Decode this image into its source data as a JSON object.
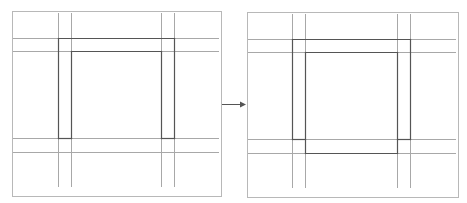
{
  "diagram": {
    "colors": {
      "panel_border": "#b8b8b8",
      "guide_line": "#a8a8a8",
      "frame_line": "#555555",
      "arrow": "#555555",
      "background": "#ffffff"
    },
    "panels": [
      {
        "name": "before",
        "border": {
          "x": 12,
          "y": 11,
          "w": 209,
          "h": 185
        },
        "vertical_guides": [
          58,
          71,
          161,
          174
        ],
        "vertical_guide_span": [
          13,
          187
        ],
        "horizontal_guides": [
          38,
          51,
          138,
          152
        ],
        "horizontal_guide_span": [
          13,
          219
        ],
        "frame_segments": [
          [
            58,
            38,
            174,
            38
          ],
          [
            58,
            38,
            58,
            138
          ],
          [
            174,
            38,
            174,
            138
          ],
          [
            58,
            138,
            71,
            138
          ],
          [
            161,
            138,
            174,
            138
          ],
          [
            71,
            51,
            161,
            51
          ],
          [
            71,
            51,
            71,
            138
          ],
          [
            161,
            51,
            161,
            138
          ]
        ]
      },
      {
        "name": "after",
        "border": {
          "x": 247,
          "y": 12,
          "w": 211,
          "h": 185
        },
        "vertical_guides": [
          292,
          305,
          397,
          410
        ],
        "vertical_guide_span": [
          14,
          188
        ],
        "horizontal_guides": [
          39,
          52,
          139,
          153
        ],
        "horizontal_guide_span": [
          248,
          456
        ],
        "frame_segments": [
          [
            292,
            39,
            410,
            39
          ],
          [
            292,
            39,
            292,
            139
          ],
          [
            410,
            39,
            410,
            139
          ],
          [
            292,
            139,
            305,
            139
          ],
          [
            397,
            139,
            410,
            139
          ],
          [
            305,
            52,
            397,
            52
          ],
          [
            305,
            52,
            305,
            153
          ],
          [
            397,
            52,
            397,
            153
          ],
          [
            305,
            153,
            397,
            153
          ]
        ]
      }
    ],
    "arrow": {
      "x1": 222,
      "y1": 104,
      "x2": 246,
      "y2": 104,
      "icon": "arrow-right-icon"
    }
  }
}
